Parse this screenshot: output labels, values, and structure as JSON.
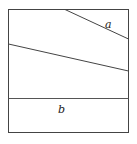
{
  "diagram": {
    "type": "geometric-figure",
    "labels": {
      "a": "a",
      "b": "b"
    },
    "colors": {
      "stroke": "#444444",
      "background": "#ffffff"
    }
  }
}
